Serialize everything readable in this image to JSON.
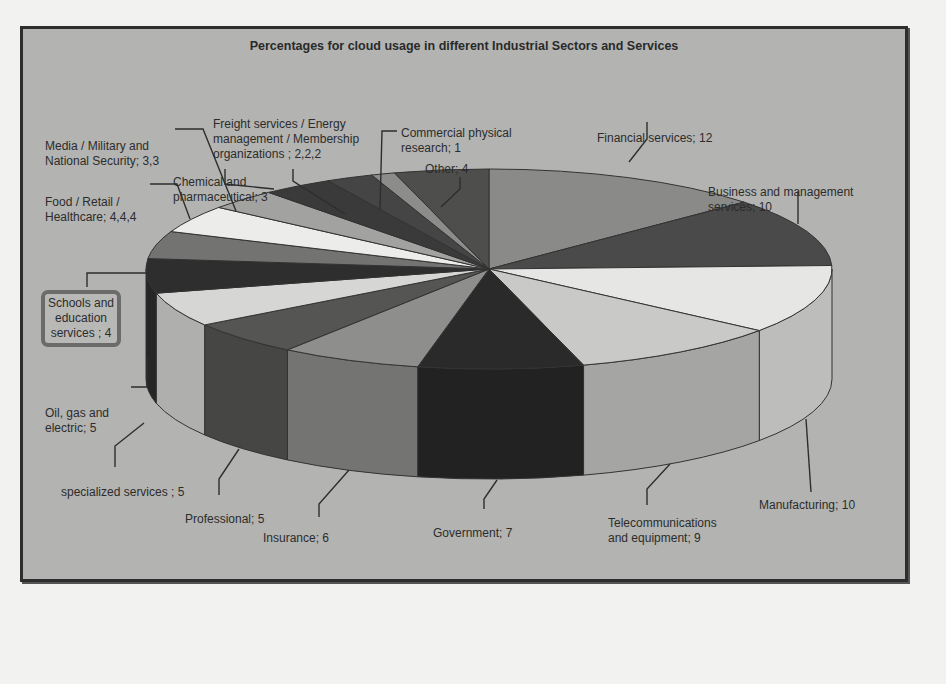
{
  "chart_data": {
    "type": "pie",
    "style": "3d",
    "title": "Percentages for cloud usage in different Industrial Sectors and Services",
    "slices": [
      {
        "label": "Financial services",
        "value": 12,
        "display": "Financial services; 12",
        "color": "#8a8a88"
      },
      {
        "label": "Business and management services",
        "value": 10,
        "display": "Business and management services; 10",
        "color": "#4a4a4a"
      },
      {
        "label": "Manufacturing",
        "value": 10,
        "display": "Manufacturing; 10",
        "color": "#e6e6e4"
      },
      {
        "label": "Telecommunications and equipment",
        "value": 9,
        "display": "Telecommunications and equipment; 9",
        "color": "#c9c9c7"
      },
      {
        "label": "Government",
        "value": 7,
        "display": "Government; 7",
        "color": "#2a2a2a"
      },
      {
        "label": "Insurance",
        "value": 6,
        "display": "Insurance; 6",
        "color": "#8e8e8c"
      },
      {
        "label": "Professional",
        "value": 5,
        "display": "Professional; 5",
        "color": "#555553"
      },
      {
        "label": "specialized services",
        "value": 5,
        "display": "specialized services ; 5",
        "color": "#d6d6d4"
      },
      {
        "label": "Oil, gas and electric",
        "value": 5,
        "display": "Oil, gas and electric; 5",
        "color": "#2e2e2e"
      },
      {
        "label": "Schools and education services",
        "value": 4,
        "display": "Schools and education services ; 4",
        "color": "#737371"
      },
      {
        "label": "Food / Retail / Healthcare",
        "value": 4,
        "display": "Food / Retail / Healthcare; 4,4,4",
        "color": "#ececea"
      },
      {
        "label": "Media / Military and National Security",
        "value": 3,
        "display": "Media / Military and National Security; 3,3",
        "color": "#a2a2a0"
      },
      {
        "label": "Chemical and pharmaceutical",
        "value": 3,
        "display": "Chemical and pharmaceutical; 3",
        "color": "#3a3a3a"
      },
      {
        "label": "Freight services / Energy management / Membership organizations",
        "value": 2,
        "display": "Freight services / Energy management / Membership organizations ; 2,2,2",
        "color": "#454545"
      },
      {
        "label": "Commercial physical research",
        "value": 1,
        "display": "Commercial physical research; 1",
        "color": "#8c8c8a"
      },
      {
        "label": "Other",
        "value": 4,
        "display": "Other; 4",
        "color": "#4e4e4c"
      }
    ],
    "highlighted_label": "Schools and education services ; 4",
    "legend": "none (data labels with leader lines)"
  },
  "labels": {
    "financial": "Financial services; 12",
    "business_1": "Business and management",
    "business_2": "services; 10",
    "manufacturing": "Manufacturing; 10",
    "telecom_1": "Telecommunications",
    "telecom_2": "and equipment; 9",
    "government": "Government; 7",
    "insurance": "Insurance; 6",
    "professional": "Professional; 5",
    "specialized": "specialized services ; 5",
    "oil_1": "Oil, gas and",
    "oil_2": "electric; 5",
    "schools_1": "Schools and",
    "schools_2": "education",
    "schools_3": "services ; 4",
    "food_1": "Food / Retail /",
    "food_2": "Healthcare; 4,4,4",
    "media_1": "Media / Military and",
    "media_2": "National Security; 3,3",
    "chemical_1": "Chemical and",
    "chemical_2": "pharmaceutical; 3",
    "freight_1": "Freight services / Energy",
    "freight_2": "management / Membership",
    "freight_3": "organizations ; 2,2,2",
    "commercial_1": "Commercial physical",
    "commercial_2": "research; 1",
    "other": "Other; 4"
  }
}
